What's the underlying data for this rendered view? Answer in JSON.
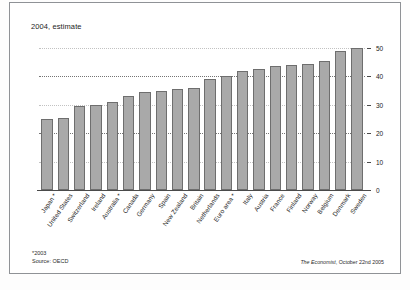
{
  "chart_title": "2004, estimate",
  "footnote": {
    "asterisk_note": "*2003",
    "source": "Source: OECD"
  },
  "attribution": {
    "publication": "The Economist",
    "date": ", October 22nd 2005"
  },
  "chart_data": {
    "type": "bar",
    "title": "2004, estimate",
    "xlabel": "",
    "ylabel": "",
    "ylim": [
      0,
      50
    ],
    "yticks": [
      0,
      10,
      20,
      30,
      40,
      50
    ],
    "grid": true,
    "legend": false,
    "bar_color": "#a9a9a9",
    "bar_border_color": "#6e6e6e",
    "categories": [
      "Japan *",
      "United States",
      "Switzerland",
      "Ireland",
      "Australia *",
      "Canada",
      "Germany",
      "Spain",
      "New Zealand",
      "Britain",
      "Netherlands",
      "Euro area *",
      "Italy",
      "Austria",
      "France",
      "Finland",
      "Norway",
      "Belgium",
      "Denmark",
      "Sweden"
    ],
    "values": [
      25,
      25.5,
      29.5,
      30,
      31,
      33,
      34.5,
      35,
      35.5,
      36,
      39,
      40,
      42,
      42.5,
      43.5,
      44,
      44.5,
      45.5,
      49,
      50
    ]
  }
}
